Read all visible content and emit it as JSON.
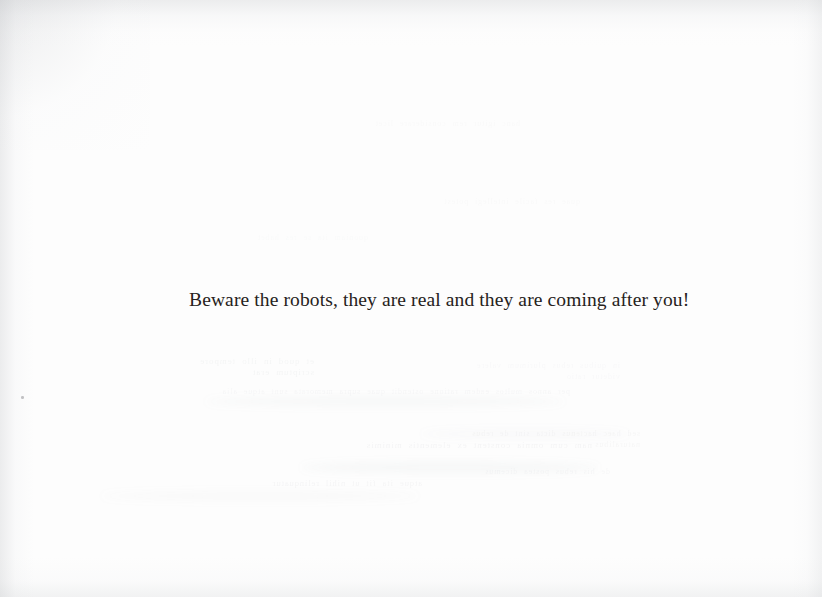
{
  "page": {
    "kind": "scanned-book-page",
    "width_px": 822,
    "height_px": 597,
    "paper_color": "#fdfdfd",
    "ink_color": "#262220"
  },
  "body": {
    "line": "Beware the robots, they are real and they are coming after you!"
  },
  "artifacts": {
    "showthrough_note": "faint mirrored bleed-through text from the reverse side of the leaf, illegible",
    "ghost_fragments": [
      "et quod in illo tempore scriptum erat",
      "per annos multos eadem ratione ostendit quae supra memorata sunt atque alia",
      "hanc igitur rem considerare licet",
      "in quibus rebus plurimum valere videtur ratio",
      "nam cum omnia constent ex elementis minimis",
      "quae res facile intellegi potest",
      "sed haec hactenus dicta sint de rebus naturalibus",
      "atque ita fit ut nihil relinquatur",
      "de his rebus postea dicemus",
      "quoniam ita se res habet"
    ],
    "fleck": {
      "x": 21,
      "y": 396
    }
  }
}
